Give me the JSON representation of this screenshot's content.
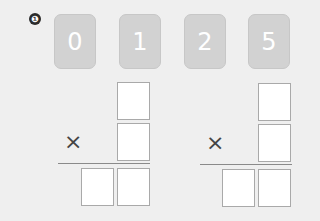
{
  "problem_number": "❶",
  "cards": [
    "0",
    "1",
    "2",
    "5"
  ],
  "operator": "×",
  "problems": [
    {
      "id": "left",
      "boxes": {
        "top": "",
        "middle": "",
        "result_tens": "",
        "result_ones": ""
      }
    },
    {
      "id": "right",
      "boxes": {
        "top": "",
        "middle": "",
        "result_tens": "",
        "result_ones": ""
      }
    }
  ]
}
